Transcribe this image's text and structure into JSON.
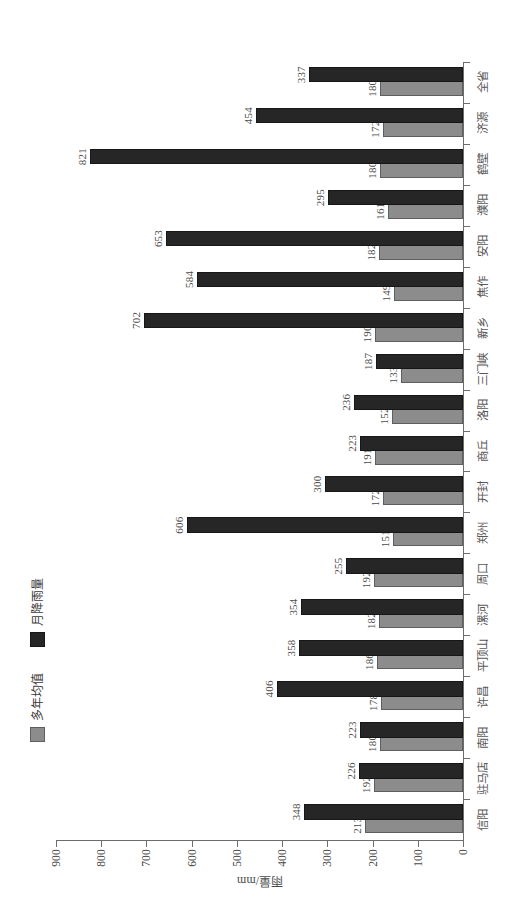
{
  "chart_data": {
    "type": "bar",
    "orientation": "horizontal",
    "title": "",
    "xlabel": "",
    "ylabel": "雨量/mm",
    "ylim": [
      0,
      900
    ],
    "ytick_labels": [
      "0",
      "100",
      "200",
      "300",
      "400",
      "500",
      "600",
      "700",
      "800",
      "900"
    ],
    "ytick_values": [
      0,
      100,
      200,
      300,
      400,
      500,
      600,
      700,
      800,
      900
    ],
    "grid": false,
    "legend_position": "top-left",
    "categories": [
      "信阳",
      "驻马店",
      "南阳",
      "许昌",
      "平顶山",
      "漯河",
      "周口",
      "郑州",
      "开封",
      "商丘",
      "洛阳",
      "三门峡",
      "新乡",
      "焦作",
      "安阳",
      "濮阳",
      "鹤壁",
      "济源",
      "全省"
    ],
    "series": [
      {
        "name": "多年均值",
        "color": "#8c8c8c",
        "values": [
          213,
          192,
          180,
          178,
          186,
          182,
          192,
          151,
          172,
          191,
          152,
          133,
          190,
          149,
          182,
          161,
          180,
          172,
          180
        ]
      },
      {
        "name": "月降雨量",
        "color": "#262626",
        "values": [
          348,
          226,
          223,
          406,
          358,
          354,
          255,
          606,
          300,
          223,
          236,
          187,
          702,
          584,
          653,
          295,
          821,
          454,
          337
        ]
      }
    ]
  },
  "legend": {
    "items": [
      {
        "label": "多年均值",
        "swatch": "gray-swatch"
      },
      {
        "label": "月降雨量",
        "swatch": "black-swatch"
      }
    ]
  },
  "axis": {
    "value_axis_title": "雨量/mm"
  }
}
